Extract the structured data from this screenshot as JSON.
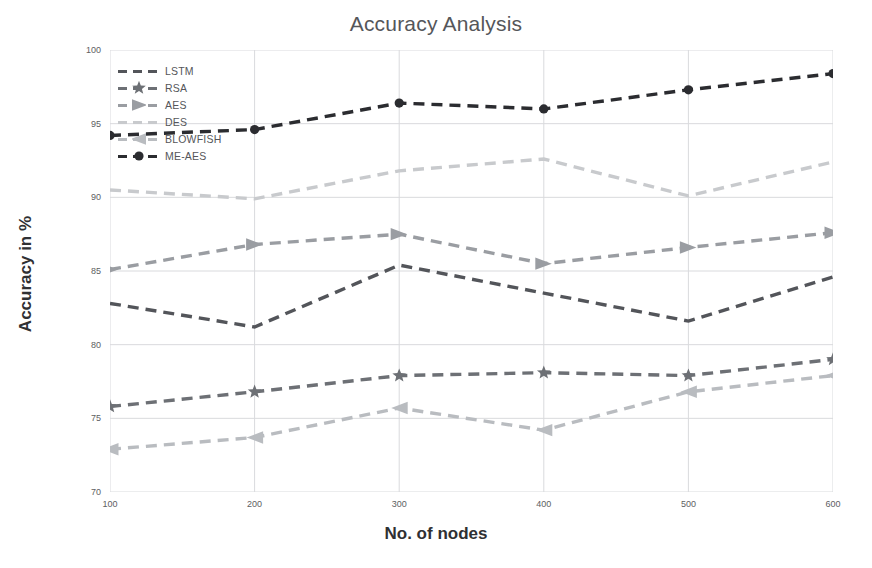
{
  "chart_data": {
    "type": "line",
    "title": "Accuracy Analysis",
    "xlabel": "No. of nodes",
    "ylabel": "Accuracy in %",
    "categories": [
      100,
      200,
      300,
      400,
      500,
      600
    ],
    "xtick_labels": [
      "100",
      "200",
      "300",
      "400",
      "500",
      "600"
    ],
    "ytick_labels": [
      "70",
      "75",
      "80",
      "85",
      "90",
      "95",
      "100"
    ],
    "yticks": [
      70,
      75,
      80,
      85,
      90,
      95,
      100
    ],
    "xlim": [
      100,
      600
    ],
    "ylim": [
      70,
      100
    ],
    "grid": true,
    "legend_position": "upper-left",
    "linestyle": "dashed",
    "series": [
      {
        "name": "LSTM",
        "marker": "none",
        "color": "#53555a",
        "values": [
          82.8,
          81.2,
          85.4,
          83.5,
          81.6,
          84.6
        ]
      },
      {
        "name": "RSA",
        "marker": "star",
        "color": "#6d7075",
        "values": [
          75.8,
          76.8,
          77.9,
          78.1,
          77.9,
          79.0
        ]
      },
      {
        "name": "AES",
        "marker": "triangle-right",
        "color": "#9a9da2",
        "values": [
          85.1,
          86.8,
          87.5,
          85.5,
          86.6,
          87.6
        ]
      },
      {
        "name": "DES",
        "marker": "none",
        "color": "#c8cacd",
        "values": [
          90.5,
          89.9,
          91.8,
          92.6,
          90.1,
          92.4
        ]
      },
      {
        "name": "BLOWFISH",
        "marker": "triangle-left",
        "color": "#b9bcc0",
        "values": [
          72.9,
          73.7,
          75.7,
          74.2,
          76.8,
          77.9
        ]
      },
      {
        "name": "ME-AES",
        "marker": "circle",
        "color": "#2b2c30",
        "values": [
          94.2,
          94.6,
          96.4,
          96.0,
          97.3,
          98.4
        ]
      }
    ]
  },
  "colors": {
    "grid": "#d9dadd",
    "axis_text": "#5d5e62",
    "title": "#55565a",
    "label": "#2f3033",
    "background": "#ffffff"
  }
}
